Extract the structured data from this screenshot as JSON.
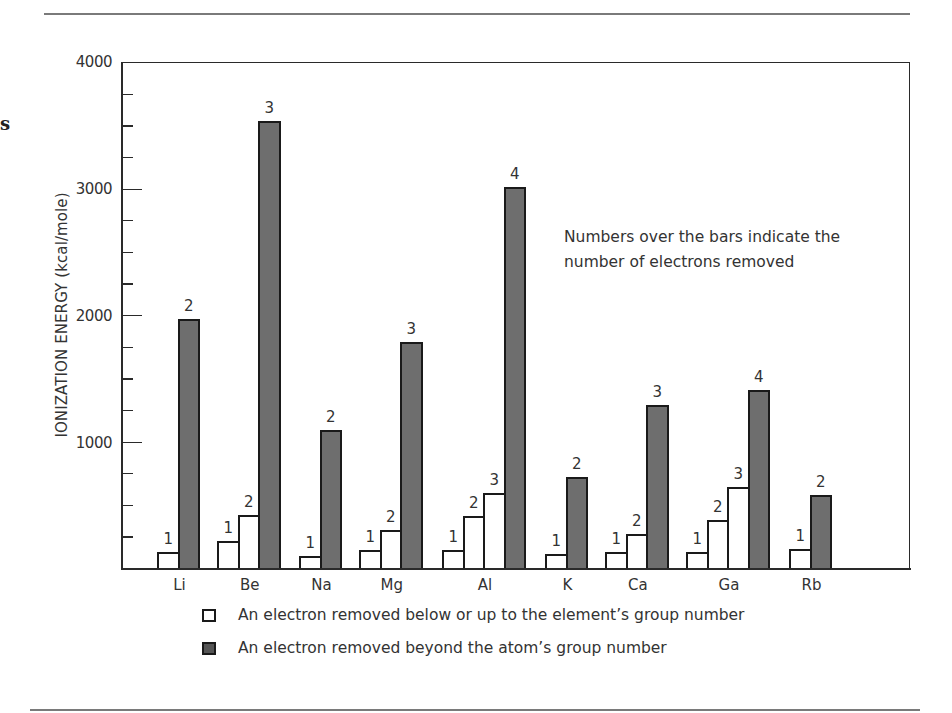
{
  "chart_data": {
    "type": "bar",
    "title": "",
    "xlabel": "",
    "ylabel": "IONIZATION ENERGY (kcal/mole)",
    "ylim": [
      0,
      4000
    ],
    "y_ticks_major": [
      1000,
      2000,
      3000,
      4000
    ],
    "y_ticks_minor_step": 250,
    "categories": [
      "Li",
      "Be",
      "Na",
      "Mg",
      "Al",
      "K",
      "Ca",
      "Ga",
      "Rb"
    ],
    "groups": [
      {
        "element": "Li",
        "bars": [
          {
            "electrons_removed": 1,
            "value": 124,
            "type": "within_group"
          },
          {
            "electrons_removed": 2,
            "value": 1968,
            "type": "beyond_group"
          }
        ]
      },
      {
        "element": "Be",
        "bars": [
          {
            "electrons_removed": 1,
            "value": 215,
            "type": "within_group"
          },
          {
            "electrons_removed": 2,
            "value": 420,
            "type": "within_group"
          },
          {
            "electrons_removed": 3,
            "value": 3536,
            "type": "beyond_group"
          }
        ]
      },
      {
        "element": "Na",
        "bars": [
          {
            "electrons_removed": 1,
            "value": 96,
            "type": "within_group"
          },
          {
            "electrons_removed": 2,
            "value": 1090,
            "type": "beyond_group"
          }
        ]
      },
      {
        "element": "Mg",
        "bars": [
          {
            "electrons_removed": 1,
            "value": 144,
            "type": "within_group"
          },
          {
            "electrons_removed": 2,
            "value": 304,
            "type": "within_group"
          },
          {
            "electrons_removed": 3,
            "value": 1784,
            "type": "beyond_group"
          }
        ]
      },
      {
        "element": "Al",
        "bars": [
          {
            "electrons_removed": 1,
            "value": 144,
            "type": "within_group"
          },
          {
            "electrons_removed": 2,
            "value": 408,
            "type": "within_group"
          },
          {
            "electrons_removed": 3,
            "value": 592,
            "type": "within_group"
          },
          {
            "electrons_removed": 4,
            "value": 3008,
            "type": "beyond_group"
          }
        ]
      },
      {
        "element": "K",
        "bars": [
          {
            "electrons_removed": 1,
            "value": 112,
            "type": "within_group"
          },
          {
            "electrons_removed": 2,
            "value": 720,
            "type": "beyond_group"
          }
        ]
      },
      {
        "element": "Ca",
        "bars": [
          {
            "electrons_removed": 1,
            "value": 128,
            "type": "within_group"
          },
          {
            "electrons_removed": 2,
            "value": 272,
            "type": "within_group"
          },
          {
            "electrons_removed": 3,
            "value": 1288,
            "type": "beyond_group"
          }
        ]
      },
      {
        "element": "Ga",
        "bars": [
          {
            "electrons_removed": 1,
            "value": 128,
            "type": "within_group"
          },
          {
            "electrons_removed": 2,
            "value": 376,
            "type": "within_group"
          },
          {
            "electrons_removed": 3,
            "value": 640,
            "type": "within_group"
          },
          {
            "electrons_removed": 4,
            "value": 1408,
            "type": "beyond_group"
          }
        ]
      },
      {
        "element": "Rb",
        "bars": [
          {
            "electrons_removed": 1,
            "value": 152,
            "type": "within_group"
          },
          {
            "electrons_removed": 2,
            "value": 576,
            "type": "beyond_group"
          }
        ]
      }
    ],
    "legend": [
      {
        "swatch": "white",
        "label": "An electron removed below or up to  the element’s group number"
      },
      {
        "swatch": "dark",
        "label": "An electron removed beyond the atom’s  group number"
      }
    ],
    "legend_position": "bottom",
    "annotation": [
      "Numbers over the bars indicate the",
      "number of electrons removed"
    ],
    "grid": false,
    "colors": {
      "within_group": "#ffffff",
      "beyond_group": "#6e6e6e",
      "outline": "#1a1a1a"
    }
  },
  "axis": {
    "y_label": "IONIZATION ENERGY (kcal/mole)",
    "tick_labels": [
      "1000",
      "2000",
      "3000",
      "4000"
    ]
  },
  "annotation": {
    "line1": "Numbers over the bars indicate the",
    "line2": "number of electrons removed"
  },
  "legend": {
    "white_label": "An electron removed below or up to  the element’s group number",
    "dark_label": "An electron removed beyond the atom’s  group number"
  },
  "margin_mark": "s"
}
